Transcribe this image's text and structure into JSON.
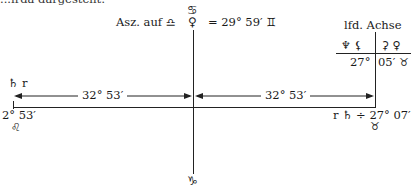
{
  "header_fragment": "...irda dargestellt:",
  "axis": {
    "top_symbol": "♋",
    "top_planet": "♀",
    "bottom_symbol": "♑"
  },
  "ascendant": {
    "label": "Asz. auf",
    "sign": "♎",
    "equals_value": "= 29° 59′",
    "equals_sign": "♊"
  },
  "running_axis": {
    "title": "lfd. Achse",
    "left_symbols": "♆ ⚸",
    "right_symbols": "⚳ ♀",
    "left_value": "27°",
    "right_value": "05′",
    "right_sign": "♉"
  },
  "left_marker": {
    "planet_label": "♄ r",
    "value": "2° 53′",
    "sign": "♌"
  },
  "right_marker": {
    "label": "r ♄ ÷ 27° 07′",
    "sign": "♉"
  },
  "arrows": {
    "left_label": "32° 53′",
    "right_label": "32° 53′"
  }
}
